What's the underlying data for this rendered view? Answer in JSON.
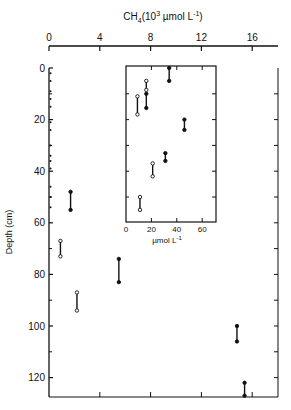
{
  "chart_data": [
    {
      "type": "line",
      "description": "Depth profile of CH4 concentration; each measurement is a vertical bar spanning a depth interval with end markers (filled or open circles).",
      "title": "",
      "xlabel": "CH4 (10^3 µmol L^-1)",
      "xlabel_display": {
        "base": "CH",
        "sub": "4",
        "pre": "(10",
        "sup": "3",
        "mid": " µmol L",
        "sup2": "-1",
        "post": ")"
      },
      "ylabel": "Depth (cm)",
      "x_axis_position": "top",
      "y_inverted": true,
      "xlim": [
        0,
        18
      ],
      "ylim": [
        0,
        128
      ],
      "xticks": [
        "0",
        "4",
        "8",
        "12",
        "16"
      ],
      "xtick_values": [
        0,
        4,
        8,
        12,
        16
      ],
      "yticks": [
        "0",
        "20",
        "40",
        "60",
        "80",
        "100",
        "120"
      ],
      "ytick_values": [
        0,
        20,
        40,
        60,
        80,
        100,
        120
      ],
      "grid": false,
      "series": [
        {
          "name": "filled",
          "marker": "filled-circle",
          "intervals": [
            {
              "x": 1.7,
              "depth_top": 48,
              "depth_bottom": 55
            },
            {
              "x": 5.5,
              "depth_top": 74,
              "depth_bottom": 83
            },
            {
              "x": 14.8,
              "depth_top": 100,
              "depth_bottom": 106
            },
            {
              "x": 15.4,
              "depth_top": 122,
              "depth_bottom": 127
            }
          ]
        },
        {
          "name": "open",
          "marker": "open-circle",
          "intervals": [
            {
              "x": 0.9,
              "depth_top": 67,
              "depth_bottom": 73
            },
            {
              "x": 2.2,
              "depth_top": 87,
              "depth_bottom": 94
            }
          ]
        },
        {
          "name": "near-zero",
          "marker": "small-tick",
          "note": "Small near-zero values along left axis, 0–55 cm (detailed in inset)"
        }
      ]
    },
    {
      "type": "line",
      "description": "Inset: upper 60 cm enlarged, CH4 in µmol L^-1",
      "xlabel": "µmol L^-1",
      "xlabel_display": {
        "text": "µmol L",
        "sup": "-1"
      },
      "xlim": [
        0,
        70
      ],
      "ylim": [
        0,
        60
      ],
      "xticks": [
        "0",
        "20",
        "40",
        "60"
      ],
      "xtick_values": [
        0,
        20,
        40,
        60
      ],
      "ytick_values": [
        0,
        10,
        20,
        30,
        40,
        50,
        60
      ],
      "series": [
        {
          "name": "filled",
          "marker": "filled-circle",
          "intervals": [
            {
              "x": 34,
              "depth_top": 0,
              "depth_bottom": 5
            },
            {
              "x": 16,
              "depth_top": 10,
              "depth_bottom": 15.5
            },
            {
              "x": 46,
              "depth_top": 20,
              "depth_bottom": 24
            },
            {
              "x": 31,
              "depth_top": 33,
              "depth_bottom": 36
            }
          ]
        },
        {
          "name": "open",
          "marker": "open-circle",
          "intervals": [
            {
              "x": 16,
              "depth_top": 5,
              "depth_bottom": 8.5
            },
            {
              "x": 9,
              "depth_top": 11,
              "depth_bottom": 18
            },
            {
              "x": 21,
              "depth_top": 37,
              "depth_bottom": 42
            },
            {
              "x": 11,
              "depth_top": 50,
              "depth_bottom": 55
            }
          ]
        }
      ]
    }
  ],
  "layout": {
    "main": {
      "left": 49,
      "top": 68,
      "right": 278,
      "bottom": 397,
      "x_px_per_unit": 12.7,
      "y_px_per_unit": 2.58,
      "x0_px": 49,
      "y0_px": 68
    },
    "inset": {
      "left": 126,
      "top": 66,
      "right": 216,
      "bottom": 222,
      "x_px_per_unit": 1.27,
      "x0_px": 126
    }
  }
}
